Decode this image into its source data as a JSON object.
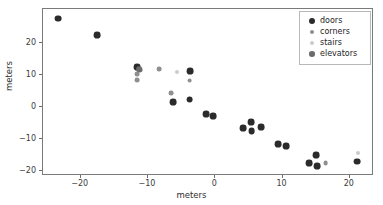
{
  "chart_data": {
    "type": "scatter",
    "title": "",
    "xlabel": "meters",
    "ylabel": "meters",
    "xlim": [
      -25.6,
      23.6
    ],
    "ylim": [
      -21.5,
      30.5
    ],
    "xticks": [
      -20,
      -10,
      0,
      10,
      20
    ],
    "xticklabels": [
      "−20",
      "−10",
      "0",
      "10",
      "20"
    ],
    "yticks": [
      20,
      10,
      0,
      -10,
      -20
    ],
    "yticklabels": [
      "20",
      "10",
      "0",
      "−10",
      "−20"
    ],
    "grid": false,
    "legend_position": "upper right",
    "series": [
      {
        "name": "doors",
        "color": "#2b2b2b",
        "marker": "circle",
        "marker_size": 3.4,
        "points": [
          {
            "x": -23.3,
            "y": 27.5
          },
          {
            "x": -17.6,
            "y": 22.4
          },
          {
            "x": -11.6,
            "y": 12.4
          },
          {
            "x": -3.7,
            "y": 11.2
          },
          {
            "x": -6.3,
            "y": 1.4
          },
          {
            "x": -3.8,
            "y": 2.3
          },
          {
            "x": -1.3,
            "y": -2.3
          },
          {
            "x": -0.3,
            "y": -2.9
          },
          {
            "x": 4.2,
            "y": -6.7
          },
          {
            "x": 5.3,
            "y": -4.8
          },
          {
            "x": 5.4,
            "y": -7.6
          },
          {
            "x": 6.8,
            "y": -6.3
          },
          {
            "x": 9.4,
            "y": -11.5
          },
          {
            "x": 10.5,
            "y": -12.1
          },
          {
            "x": 13.9,
            "y": -17.5
          },
          {
            "x": 15.0,
            "y": -14.9
          },
          {
            "x": 15.1,
            "y": -18.3
          },
          {
            "x": 21.1,
            "y": -17.0
          }
        ]
      },
      {
        "name": "corners",
        "color": "#8f8f8f",
        "marker": "circle",
        "marker_size": 2.4,
        "points": [
          {
            "x": -11.2,
            "y": 11.4
          },
          {
            "x": -11.6,
            "y": 10.2
          },
          {
            "x": -11.6,
            "y": 8.3
          },
          {
            "x": -8.4,
            "y": 11.7
          },
          {
            "x": -6.6,
            "y": 4.2
          },
          {
            "x": -3.8,
            "y": 8.2
          },
          {
            "x": 16.4,
            "y": -17.4
          }
        ]
      },
      {
        "name": "stairs",
        "color": "#cccccc",
        "marker": "circle",
        "marker_size": 2.0,
        "points": [
          {
            "x": -5.7,
            "y": 11.0
          },
          {
            "x": 21.2,
            "y": -14.4
          }
        ]
      },
      {
        "name": "elevators",
        "color": "#6b6b6b",
        "marker": "circle",
        "marker_size": 2.8,
        "points": [
          {
            "x": -11.3,
            "y": 11.8
          }
        ]
      }
    ]
  },
  "legend": {
    "entries": [
      {
        "label": "doors"
      },
      {
        "label": "corners"
      },
      {
        "label": "stairs"
      },
      {
        "label": "elevators"
      }
    ]
  },
  "axes": {
    "xlabel": "meters",
    "ylabel": "meters"
  }
}
